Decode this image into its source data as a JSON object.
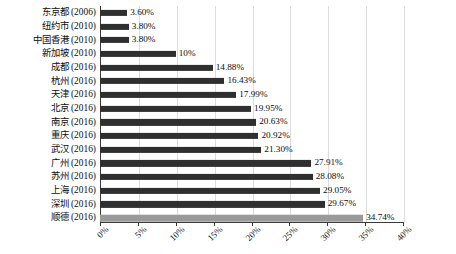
{
  "chart_data": {
    "type": "bar",
    "orientation": "horizontal",
    "title": "",
    "subtitle": "",
    "xlabel": "",
    "ylabel": "",
    "xlim": [
      0,
      40
    ],
    "xunit": "%",
    "grid": true,
    "legend": false,
    "xticks": [
      "0%",
      "5%",
      "10%",
      "15%",
      "20%",
      "25%",
      "30%",
      "35%",
      "40%"
    ],
    "xtick_values": [
      0,
      5,
      10,
      15,
      20,
      25,
      30,
      35,
      40
    ],
    "categories": [
      "东京都 (2006)",
      "纽约市 (2010)",
      "中国香港 (2010)",
      "新加坡 (2010)",
      "成都 (2016)",
      "杭州 (2016)",
      "天津 (2016)",
      "北京 (2016)",
      "南京 (2016)",
      "重庆 (2016)",
      "武汉 (2016)",
      "广州 (2016)",
      "苏州 (2016)",
      "上海 (2016)",
      "深圳 (2016)",
      "顺德 (2016)"
    ],
    "values": [
      3.6,
      3.8,
      3.8,
      10,
      14.88,
      16.43,
      17.99,
      19.95,
      20.63,
      20.92,
      21.3,
      27.91,
      28.08,
      29.05,
      29.67,
      34.74
    ],
    "labels": [
      "3.60%",
      "3.80%",
      "3.80%",
      "",
      "10%",
      "14.88%",
      "16.43%",
      "17.99%",
      "19.95%",
      "20.63%",
      "20.92%",
      "21.30%",
      "27.91%",
      "28.08%",
      "29.05%",
      "29.67%",
      "34.74%"
    ],
    "bar_labels": [
      "3.60%",
      "3.80%",
      "3.80%",
      "10%",
      "14.88%",
      "16.43%",
      "17.99%",
      "19.95%",
      "20.63%",
      "20.92%",
      "21.30%",
      "27.91%",
      "28.08%",
      "29.05%",
      "29.67%",
      "34.74%"
    ],
    "highlight_index": 15,
    "colors": {
      "bar": "#2f2f2f",
      "bar_highlight": "#9a9a9a",
      "grid": "#dcdcdc",
      "axis": "#3a3a3a",
      "text": "#0d0d0d",
      "background": "#ffffff"
    }
  }
}
